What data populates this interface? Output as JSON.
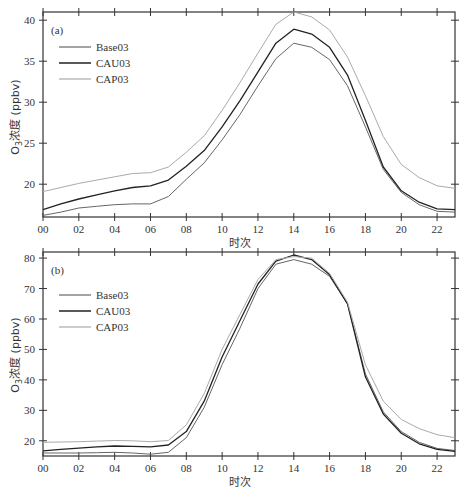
{
  "chart_data": [
    {
      "type": "line",
      "panel_label": "(a)",
      "xlabel": "时次",
      "ylabel": "O3浓度 (ppbv)",
      "ylabel_parts": {
        "prefix": "O",
        "sub": "3",
        "suffix": "浓度 (ppbv)"
      },
      "x": [
        0,
        1,
        2,
        3,
        4,
        5,
        6,
        7,
        8,
        9,
        10,
        11,
        12,
        13,
        14,
        15,
        16,
        17,
        18,
        19,
        20,
        21,
        22,
        23
      ],
      "x_tick_labels": [
        "00",
        "02",
        "04",
        "06",
        "08",
        "10",
        "12",
        "14",
        "16",
        "18",
        "20",
        "22"
      ],
      "y_ticks": [
        20,
        25,
        30,
        35,
        40
      ],
      "ylim": [
        16,
        41
      ],
      "xlim": [
        0,
        23
      ],
      "legend": [
        "Base03",
        "CAU03",
        "CAP03"
      ],
      "series": [
        {
          "name": "Base03",
          "color": "#666666",
          "width": 1.0,
          "values": [
            16.2,
            16.6,
            17.1,
            17.3,
            17.5,
            17.6,
            17.6,
            18.5,
            20.6,
            22.6,
            25.4,
            28.5,
            32.0,
            35.3,
            37.2,
            36.7,
            35.2,
            32.0,
            27.0,
            21.8,
            19.0,
            17.5,
            16.7,
            16.6
          ]
        },
        {
          "name": "CAU03",
          "color": "#222222",
          "width": 1.3,
          "values": [
            16.9,
            17.6,
            18.2,
            18.7,
            19.2,
            19.6,
            19.8,
            20.5,
            22.2,
            24.1,
            27.0,
            30.2,
            33.7,
            37.2,
            38.9,
            38.3,
            36.7,
            33.3,
            27.8,
            22.1,
            19.2,
            17.8,
            17.0,
            16.9
          ]
        },
        {
          "name": "CAP03",
          "color": "#aaaaaa",
          "width": 1.0,
          "values": [
            19.1,
            19.6,
            20.1,
            20.5,
            20.9,
            21.3,
            21.4,
            22.1,
            23.9,
            25.9,
            29.0,
            32.4,
            36.0,
            39.5,
            41.0,
            40.4,
            38.8,
            35.5,
            30.8,
            25.8,
            22.4,
            20.8,
            19.8,
            19.5
          ]
        }
      ]
    },
    {
      "type": "line",
      "panel_label": "(b)",
      "xlabel": "时次",
      "ylabel": "O3浓度 (ppbv)",
      "ylabel_parts": {
        "prefix": "O",
        "sub": "3",
        "suffix": "浓度 (ppbv)"
      },
      "x": [
        0,
        1,
        2,
        3,
        4,
        5,
        6,
        7,
        8,
        9,
        10,
        11,
        12,
        13,
        14,
        15,
        16,
        17,
        18,
        19,
        20,
        21,
        22,
        23
      ],
      "x_tick_labels": [
        "00",
        "02",
        "04",
        "06",
        "08",
        "10",
        "12",
        "14",
        "16",
        "18",
        "20",
        "22"
      ],
      "y_ticks": [
        20,
        30,
        40,
        50,
        60,
        70,
        80
      ],
      "ylim": [
        15,
        82
      ],
      "xlim": [
        0,
        23
      ],
      "legend": [
        "Base03",
        "CAU03",
        "CAP03"
      ],
      "series": [
        {
          "name": "Base03",
          "color": "#666666",
          "width": 1.0,
          "values": [
            16.0,
            16.0,
            16.0,
            16.1,
            16.2,
            16.0,
            15.6,
            16.2,
            21.0,
            31.0,
            45.0,
            57.0,
            70.0,
            78.0,
            79.5,
            78.0,
            74.0,
            65.0,
            42.0,
            29.5,
            23.0,
            19.5,
            17.5,
            16.8
          ]
        },
        {
          "name": "CAU03",
          "color": "#222222",
          "width": 1.3,
          "values": [
            16.7,
            17.2,
            17.6,
            18.0,
            18.3,
            18.2,
            18.0,
            18.6,
            23.0,
            33.0,
            47.5,
            59.5,
            71.5,
            79.0,
            81.0,
            79.5,
            74.5,
            65.0,
            41.0,
            28.8,
            22.5,
            19.0,
            17.2,
            16.5
          ]
        },
        {
          "name": "CAP03",
          "color": "#aaaaaa",
          "width": 1.0,
          "values": [
            19.5,
            19.6,
            19.7,
            19.9,
            20.1,
            20.0,
            19.7,
            20.1,
            25.2,
            35.5,
            50.0,
            61.5,
            73.0,
            79.5,
            80.5,
            80.0,
            75.0,
            65.5,
            45.0,
            33.0,
            27.0,
            24.0,
            22.0,
            21.0
          ]
        }
      ]
    }
  ]
}
